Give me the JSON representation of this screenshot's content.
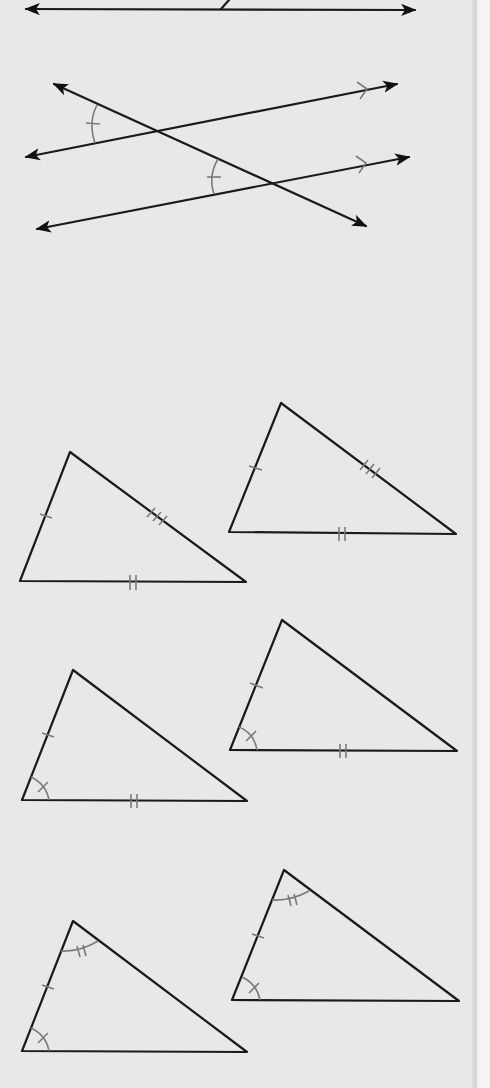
{
  "figure": {
    "type": "geometry-worksheet",
    "colors": {
      "background": "#e8e8e8",
      "line": "#1a1a1a",
      "marking": "#7a7a7a",
      "gutter": "#f4f4f4"
    },
    "sections": [
      {
        "id": "top-line",
        "description": "Horizontal line with double arrowheads, with a short segment of a diagonal line meeting it from above (cropped)"
      },
      {
        "id": "parallel-lines-transversal",
        "description": "Two parallel lines (single arrow parallel marks) cut by a transversal; corresponding angles marked congruent with single tick arcs"
      },
      {
        "id": "triangle-pair-sss",
        "description": "Two triangles with congruent sides marked: one tick, two ticks, three ticks",
        "markings": [
          "single tick on left side",
          "triple tick on right side",
          "double tick on base"
        ]
      },
      {
        "id": "triangle-pair-sas",
        "description": "Two triangles with two sides and included angle marked",
        "markings": [
          "single tick on left side",
          "single-tick arc at bottom-left angle",
          "double tick on base"
        ]
      },
      {
        "id": "triangle-pair-asa",
        "description": "Two triangles with two angles and included side marked",
        "markings": [
          "double-tick arc at top angle",
          "single tick on left side",
          "single-tick arc at bottom-left angle"
        ]
      }
    ]
  }
}
